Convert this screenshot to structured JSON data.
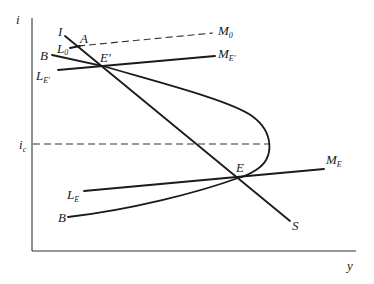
{
  "diagram": {
    "type": "economics-equilibrium-diagram",
    "axes": {
      "y_label": "i",
      "x_label": "y"
    },
    "reference_lines": {
      "ic": {
        "label": "i",
        "subscript": "c",
        "style": "dashed"
      },
      "m0": {
        "label": "M",
        "subscript": "0",
        "style": "dashed"
      }
    },
    "curves": {
      "is_curve": {
        "start_label": "I",
        "end_label": "S"
      },
      "bb_curve": {
        "upper_label": "B",
        "lower_label": "B"
      },
      "lm_e_prime": {
        "start_label": "L",
        "start_sub": "E'",
        "end_label": "M",
        "end_sub": "E'"
      },
      "lm_e": {
        "start_label": "L",
        "start_sub": "E",
        "end_label": "M",
        "end_sub": "E"
      },
      "l0": {
        "label": "L",
        "subscript": "0"
      }
    },
    "points": {
      "a": {
        "label": "A"
      },
      "e_prime": {
        "label": "E'"
      },
      "e": {
        "label": "E"
      }
    }
  }
}
